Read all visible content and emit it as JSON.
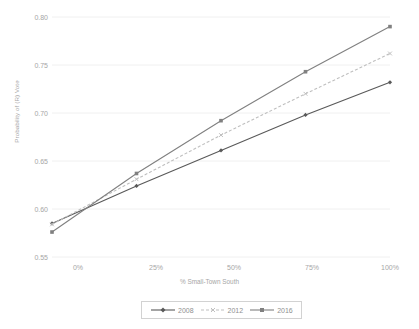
{
  "chart_data": {
    "type": "line",
    "title": "",
    "xlabel": "% Small-Town South",
    "ylabel": "Probability of (R) Vote",
    "categories": [
      "0%",
      "25%",
      "50%",
      "75%",
      "100%"
    ],
    "x": [
      0,
      25,
      50,
      75,
      100
    ],
    "xlim": [
      0,
      100
    ],
    "ylim": [
      0.55,
      0.8
    ],
    "yticks": [
      "0.55",
      "0.60",
      "0.65",
      "0.70",
      "0.75",
      "0.80"
    ],
    "ytick_values": [
      0.55,
      0.6,
      0.65,
      0.7,
      0.75,
      0.8
    ],
    "grid": "horizontal",
    "legend_position": "bottom",
    "series": [
      {
        "name": "2008",
        "values": [
          0.585,
          0.624,
          0.661,
          0.698,
          0.732
        ],
        "color": "#595959",
        "style": "solid",
        "marker": "diamond"
      },
      {
        "name": "2012",
        "values": [
          0.584,
          0.631,
          0.677,
          0.72,
          0.762
        ],
        "color": "#bfbfbf",
        "style": "dashed",
        "marker": "x"
      },
      {
        "name": "2016",
        "values": [
          0.576,
          0.637,
          0.692,
          0.743,
          0.79
        ],
        "color": "#808080",
        "style": "solid",
        "marker": "square"
      }
    ]
  },
  "axes": {
    "y_title": "Probability of (R) Vote",
    "x_title": "% Small-Town South",
    "y_labels": [
      "0.80",
      "0.75",
      "0.70",
      "0.65",
      "0.60",
      "0.55"
    ],
    "x_labels": [
      "0%",
      "25%",
      "50%",
      "75%",
      "100%"
    ]
  },
  "legend": {
    "items": [
      {
        "label": "2008"
      },
      {
        "label": "2012"
      },
      {
        "label": "2016"
      }
    ]
  },
  "colors": {
    "background": "#ffffff",
    "gridline": "#f0f0f0",
    "text": "#a6a6a6",
    "series_2008": "#595959",
    "series_2012": "#bfbfbf",
    "series_2016": "#808080"
  }
}
